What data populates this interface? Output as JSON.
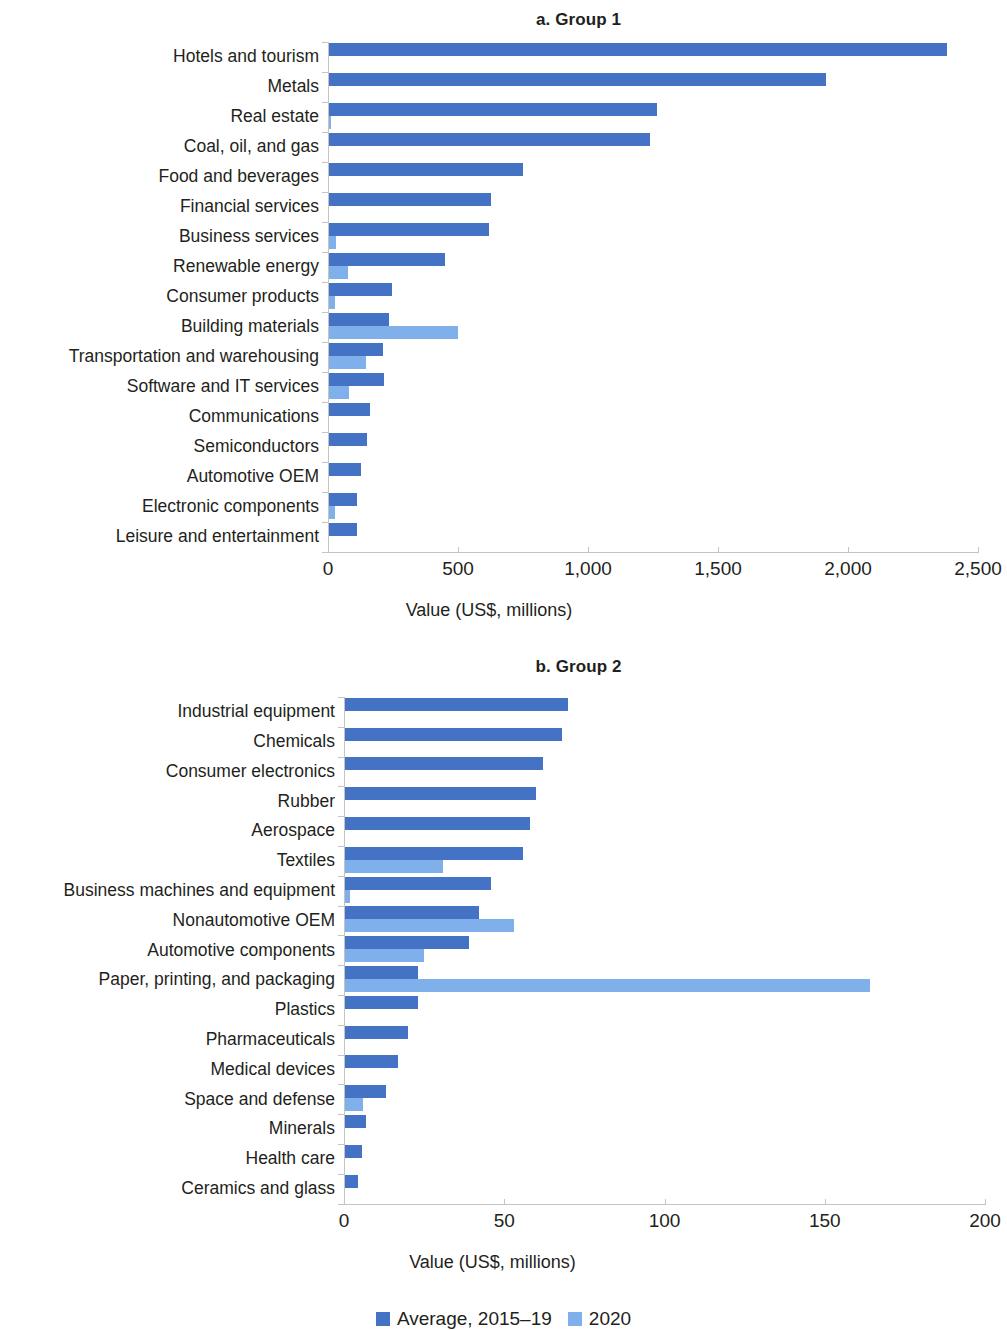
{
  "figure": {
    "legend": {
      "items": [
        {
          "label": "Average, 2015–19",
          "color": "#4472c4",
          "key": "avg"
        },
        {
          "label": "2020",
          "color": "#7fb0ec",
          "key": "y2020"
        }
      ]
    }
  },
  "chart_data": [
    {
      "id": "group-1",
      "type": "bar",
      "orientation": "horizontal",
      "title": "a. Group 1",
      "xlabel": "Value (US$, millions)",
      "ylabel": "",
      "xlim": [
        0,
        2500
      ],
      "xticks": [
        0,
        500,
        1000,
        1500,
        2000,
        2500
      ],
      "xtick_labels": [
        "0",
        "500",
        "1,000",
        "1,500",
        "2,000",
        "2,500"
      ],
      "grid": false,
      "legend_position": "bottom-center",
      "categories": [
        "Hotels and tourism",
        "Metals",
        "Real estate",
        "Coal, oil, and gas",
        "Food and beverages",
        "Financial services",
        "Business services",
        "Renewable energy",
        "Consumer products",
        "Building materials",
        "Transportation and warehousing",
        "Software and IT services",
        "Communications",
        "Semiconductors",
        "Automotive OEM",
        "Electronic components",
        "Leisure and entertainment"
      ],
      "series": [
        {
          "name": "Average, 2015–19",
          "color": "#4472c4",
          "values": [
            2380,
            1915,
            1265,
            1240,
            750,
            625,
            620,
            450,
            245,
            235,
            210,
            215,
            160,
            150,
            125,
            110,
            110
          ]
        },
        {
          "name": "2020",
          "color": "#7fb0ec",
          "values": [
            0,
            0,
            10,
            0,
            5,
            0,
            30,
            75,
            25,
            500,
            145,
            80,
            0,
            0,
            0,
            25,
            0
          ]
        }
      ]
    },
    {
      "id": "group-2",
      "type": "bar",
      "orientation": "horizontal",
      "title": "b. Group 2",
      "xlabel": "Value (US$, millions)",
      "ylabel": "",
      "xlim": [
        0,
        200
      ],
      "xticks": [
        0,
        50,
        100,
        150,
        200
      ],
      "xtick_labels": [
        "0",
        "50",
        "100",
        "150",
        "200"
      ],
      "grid": false,
      "legend_position": "bottom-center",
      "categories": [
        "Industrial equipment",
        "Chemicals",
        "Consumer electronics",
        "Rubber",
        "Aerospace",
        "Textiles",
        "Business machines and equipment",
        "Nonautomotive OEM",
        "Automotive components",
        "Paper, printing, and packaging",
        "Plastics",
        "Pharmaceuticals",
        "Medical devices",
        "Space and defense",
        "Minerals",
        "Health care",
        "Ceramics and glass"
      ],
      "series": [
        {
          "name": "Average, 2015–19",
          "color": "#4472c4",
          "values": [
            70,
            68,
            62,
            60,
            58,
            56,
            46,
            42,
            39,
            23,
            23,
            20,
            17,
            13,
            7,
            5.5,
            4.5
          ]
        },
        {
          "name": "2020",
          "color": "#7fb0ec",
          "values": [
            0,
            0,
            0,
            0,
            0,
            31,
            2,
            53,
            25,
            164,
            0,
            0,
            0,
            6,
            0,
            0,
            0
          ]
        }
      ]
    }
  ]
}
